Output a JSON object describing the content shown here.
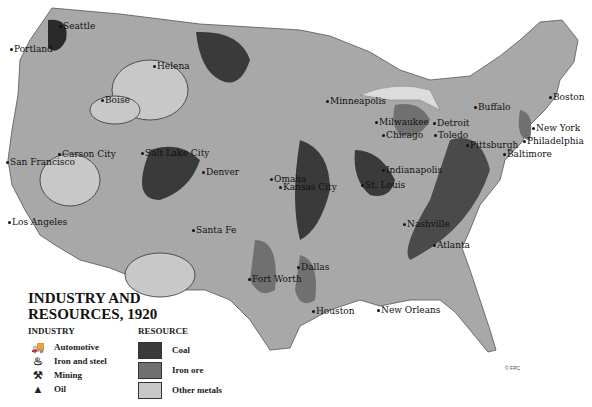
{
  "map": {
    "title": "INDUSTRY AND RESOURCES, 1920",
    "title_line1": "INDUSTRY AND",
    "title_line2": "RESOURCES, 1920",
    "copyright": "© FPC",
    "colors": {
      "land": "#a8a8a8",
      "coal": "#3a3a3a",
      "iron_ore": "#707070",
      "other_metals": "#c8c8c8",
      "water": "#ffffff"
    },
    "legend": {
      "industry_heading": "INDUSTRY",
      "industry": [
        {
          "icon": "automotive-icon",
          "glyph": "🚚",
          "label": "Automotive"
        },
        {
          "icon": "iron-steel-icon",
          "glyph": "♨",
          "label": "Iron and steel"
        },
        {
          "icon": "mining-icon",
          "glyph": "⚒",
          "label": "Mining"
        },
        {
          "icon": "oil-derrick-icon",
          "glyph": "▲",
          "label": "Oil"
        }
      ],
      "resource_heading": "RESOURCE",
      "resource": [
        {
          "label": "Coal",
          "color": "#3a3a3a"
        },
        {
          "label": "Iron ore",
          "color": "#707070"
        },
        {
          "label": "Other metals",
          "color": "#c8c8c8"
        }
      ]
    },
    "cities": [
      {
        "name": "Seattle",
        "x": 63,
        "y": 22
      },
      {
        "name": "Portland",
        "x": 14,
        "y": 45
      },
      {
        "name": "Helena",
        "x": 157,
        "y": 62
      },
      {
        "name": "Boise",
        "x": 105,
        "y": 96
      },
      {
        "name": "Minneapolis",
        "x": 330,
        "y": 97
      },
      {
        "name": "Milwaukee",
        "x": 379,
        "y": 118
      },
      {
        "name": "Detroit",
        "x": 437,
        "y": 119
      },
      {
        "name": "Buffalo",
        "x": 478,
        "y": 103
      },
      {
        "name": "Boston",
        "x": 553,
        "y": 93
      },
      {
        "name": "Chicago",
        "x": 386,
        "y": 131
      },
      {
        "name": "Toledo",
        "x": 438,
        "y": 131
      },
      {
        "name": "Pittsburgh",
        "x": 470,
        "y": 141
      },
      {
        "name": "New York",
        "x": 536,
        "y": 124
      },
      {
        "name": "Philadelphia",
        "x": 527,
        "y": 137
      },
      {
        "name": "Baltimore",
        "x": 507,
        "y": 150
      },
      {
        "name": "Carson City",
        "x": 62,
        "y": 150
      },
      {
        "name": "San Francisco",
        "x": 10,
        "y": 158
      },
      {
        "name": "Salt Lake City",
        "x": 145,
        "y": 149
      },
      {
        "name": "Denver",
        "x": 206,
        "y": 168
      },
      {
        "name": "Omaha",
        "x": 274,
        "y": 175
      },
      {
        "name": "Indianapolis",
        "x": 386,
        "y": 166
      },
      {
        "name": "Kansas City",
        "x": 283,
        "y": 183
      },
      {
        "name": "St. Louis",
        "x": 365,
        "y": 181
      },
      {
        "name": "Los Angeles",
        "x": 12,
        "y": 218
      },
      {
        "name": "Nashville",
        "x": 407,
        "y": 220
      },
      {
        "name": "Santa Fe",
        "x": 196,
        "y": 226
      },
      {
        "name": "Atlanta",
        "x": 437,
        "y": 241
      },
      {
        "name": "Dallas",
        "x": 301,
        "y": 263
      },
      {
        "name": "Fort Worth",
        "x": 252,
        "y": 275
      },
      {
        "name": "Houston",
        "x": 316,
        "y": 307
      },
      {
        "name": "New Orleans",
        "x": 381,
        "y": 306
      }
    ]
  }
}
